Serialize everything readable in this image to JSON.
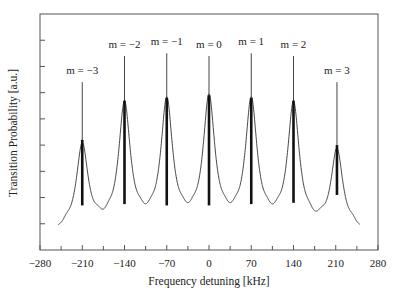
{
  "chart_data": {
    "type": "line",
    "title": "",
    "xlabel": "Frequency detuning [kHz]",
    "ylabel": "Transition Probability [a.u.]",
    "xlim": [
      -280,
      280
    ],
    "ylim": [
      0,
      9
    ],
    "xticks": [
      -280,
      -210,
      -140,
      -70,
      0,
      70,
      140,
      210,
      280
    ],
    "xtick_labels": [
      "−280",
      "−210",
      "−140",
      "−70",
      "0",
      "70",
      "140",
      "210",
      "280"
    ],
    "x_minor_ticks": [
      -245,
      -175,
      -105,
      -35,
      35,
      105,
      175,
      245
    ],
    "yticks": [
      1,
      2,
      3,
      4,
      5,
      6,
      7,
      8
    ],
    "ytick_labels_shown": false,
    "grid": false,
    "legend": null,
    "envelope": {
      "name": "Transition probability spectrum",
      "x_range": [
        -250,
        250
      ],
      "baseline_min": 0.6,
      "peak_width_khz": 14
    },
    "peaks": [
      {
        "label": "m=−3",
        "center": -210,
        "envelope_peak": 3.9,
        "line_top": 6.4,
        "line_bottom": 1.7
      },
      {
        "label": "m=−2",
        "center": -140,
        "envelope_peak": 5.4,
        "line_top": 7.4,
        "line_bottom": 1.75
      },
      {
        "label": "m=−1",
        "center": -70,
        "envelope_peak": 5.5,
        "line_top": 7.5,
        "line_bottom": 1.7
      },
      {
        "label": "m=0",
        "center": 0,
        "envelope_peak": 5.6,
        "line_top": 7.4,
        "line_bottom": 1.7
      },
      {
        "label": "m=1",
        "center": 70,
        "envelope_peak": 5.5,
        "line_top": 7.5,
        "line_bottom": 1.75
      },
      {
        "label": "m=2",
        "center": 140,
        "envelope_peak": 5.4,
        "line_top": 7.4,
        "line_bottom": 1.8
      },
      {
        "label": "m=3",
        "center": 212,
        "envelope_peak": 3.7,
        "line_top": 6.4,
        "line_bottom": 2.1
      }
    ]
  }
}
